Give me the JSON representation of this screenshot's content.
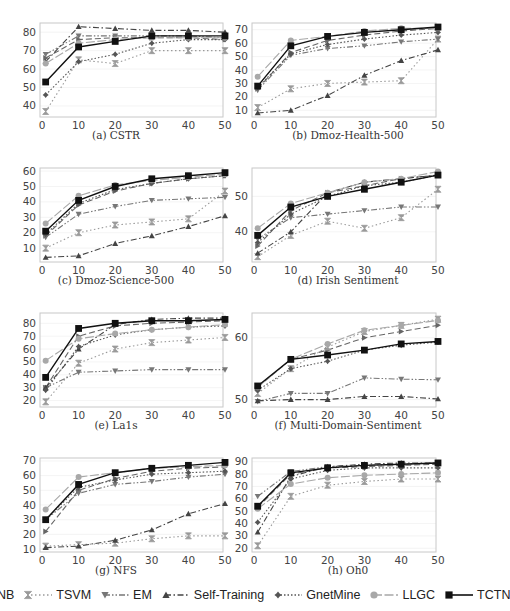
{
  "legend": [
    {
      "name": "MNB",
      "marker": "tri-right",
      "dash": "6,3",
      "color": "#666666"
    },
    {
      "name": "TSVM",
      "marker": "hourglass",
      "dash": "1.5,2.5",
      "color": "#9a9a9a"
    },
    {
      "name": "EM",
      "marker": "tri-down",
      "dash": "6,2,1.5,2,1.5,2",
      "color": "#777777"
    },
    {
      "name": "Self-Training",
      "marker": "tri-up",
      "dash": "6,2.5,1.5,2.5",
      "color": "#444444"
    },
    {
      "name": "GnetMine",
      "marker": "diamond-star",
      "dash": "1.5,2",
      "color": "#555555"
    },
    {
      "name": "LLGC",
      "marker": "circle",
      "dash": "9,2.5",
      "color": "#a8a8a8"
    },
    {
      "name": "TCTN",
      "marker": "square",
      "dash": "",
      "color": "#111111"
    }
  ],
  "chart_data": [
    {
      "id": "a",
      "caption": "(a) CSTR",
      "type": "line",
      "x": [
        1,
        10,
        20,
        30,
        40,
        50
      ],
      "xticks": [
        0,
        10,
        20,
        30,
        40,
        50
      ],
      "ylim": [
        34,
        85
      ],
      "yticks": [
        40,
        50,
        60,
        70,
        80
      ],
      "ytick_side": "left",
      "series": [
        {
          "name": "MNB",
          "values": [
            66,
            76,
            77,
            77,
            77,
            76
          ]
        },
        {
          "name": "TSVM",
          "values": [
            37,
            65,
            63,
            70,
            70,
            70
          ]
        },
        {
          "name": "EM",
          "values": [
            68,
            78,
            78,
            78,
            78,
            77
          ]
        },
        {
          "name": "Self-Training",
          "values": [
            64,
            83,
            82,
            81,
            81,
            80
          ]
        },
        {
          "name": "GnetMine",
          "values": [
            46,
            64,
            68,
            74,
            76,
            76
          ]
        },
        {
          "name": "LLGC",
          "values": [
            63,
            74,
            76,
            77,
            77,
            77
          ]
        },
        {
          "name": "TCTN",
          "values": [
            53,
            72,
            75,
            78,
            78,
            78
          ]
        }
      ]
    },
    {
      "id": "b",
      "caption": "(b) Dmoz-Health-500",
      "type": "line",
      "x": [
        1,
        10,
        20,
        30,
        40,
        50
      ],
      "xticks": [
        0,
        10,
        20,
        30,
        40,
        50
      ],
      "ylim": [
        5,
        75
      ],
      "yticks": [
        10,
        20,
        30,
        40,
        50,
        60,
        70
      ],
      "ytick_side": "left",
      "series": [
        {
          "name": "MNB",
          "values": [
            26,
            53,
            62,
            66,
            69,
            71
          ]
        },
        {
          "name": "TSVM",
          "values": [
            12,
            26,
            30,
            31,
            32,
            63
          ]
        },
        {
          "name": "EM",
          "values": [
            25,
            51,
            56,
            58,
            61,
            63
          ]
        },
        {
          "name": "Self-Training",
          "values": [
            8,
            10,
            21,
            36,
            47,
            55
          ]
        },
        {
          "name": "GnetMine",
          "values": [
            27,
            52,
            59,
            63,
            66,
            68
          ]
        },
        {
          "name": "LLGC",
          "values": [
            35,
            62,
            65,
            69,
            71,
            71
          ]
        },
        {
          "name": "TCTN",
          "values": [
            28,
            58,
            65,
            68,
            70,
            72
          ]
        }
      ]
    },
    {
      "id": "c",
      "caption": "(c) Dmoz-Science-500",
      "type": "line",
      "x": [
        1,
        10,
        20,
        30,
        40,
        50
      ],
      "xticks": [
        0,
        10,
        20,
        30,
        40,
        50
      ],
      "ylim": [
        1,
        62
      ],
      "yticks": [
        10,
        20,
        30,
        40,
        50,
        60
      ],
      "ytick_side": "left",
      "series": [
        {
          "name": "MNB",
          "values": [
            18,
            38,
            47,
            52,
            55,
            57
          ]
        },
        {
          "name": "TSVM",
          "values": [
            10,
            20,
            25,
            27,
            29,
            47
          ]
        },
        {
          "name": "EM",
          "values": [
            17,
            32,
            37,
            41,
            42,
            43
          ]
        },
        {
          "name": "Self-Training",
          "values": [
            4,
            5,
            13,
            18,
            24,
            31
          ]
        },
        {
          "name": "GnetMine",
          "values": [
            19,
            39,
            48,
            52,
            55,
            57
          ]
        },
        {
          "name": "LLGC",
          "values": [
            26,
            44,
            51,
            54,
            56,
            58
          ]
        },
        {
          "name": "TCTN",
          "values": [
            21,
            41,
            50,
            55,
            57,
            59
          ]
        }
      ]
    },
    {
      "id": "d",
      "caption": "(d) Irish Sentiment",
      "type": "line",
      "x": [
        1,
        10,
        20,
        30,
        40,
        50
      ],
      "xticks": [
        0,
        10,
        20,
        30,
        40,
        50
      ],
      "ylim": [
        31.5,
        58
      ],
      "yticks": [
        40,
        50
      ],
      "ytick_side": "left",
      "series": [
        {
          "name": "MNB",
          "values": [
            36,
            46,
            51,
            53,
            55,
            56
          ]
        },
        {
          "name": "TSVM",
          "values": [
            33,
            39,
            43,
            41,
            44,
            52
          ]
        },
        {
          "name": "EM",
          "values": [
            38,
            44,
            45,
            46,
            47,
            47
          ]
        },
        {
          "name": "Self-Training",
          "values": [
            34,
            40,
            51,
            54,
            55,
            56
          ]
        },
        {
          "name": "GnetMine",
          "values": [
            37,
            45,
            50,
            53,
            54,
            56
          ]
        },
        {
          "name": "LLGC",
          "values": [
            41,
            48,
            51,
            54,
            55,
            57
          ]
        },
        {
          "name": "TCTN",
          "values": [
            39,
            47,
            50,
            52,
            54,
            56
          ]
        }
      ]
    },
    {
      "id": "e",
      "caption": "(e) La1s",
      "type": "line",
      "x": [
        1,
        10,
        20,
        30,
        40,
        50
      ],
      "xticks": [
        0,
        10,
        20,
        30,
        40,
        50
      ],
      "ylim": [
        15,
        88
      ],
      "yticks": [
        20,
        30,
        40,
        50,
        60,
        70,
        80
      ],
      "ytick_side": "left",
      "series": [
        {
          "name": "MNB",
          "values": [
            30,
            70,
            78,
            80,
            81,
            82
          ]
        },
        {
          "name": "TSVM",
          "values": [
            19,
            49,
            60,
            65,
            67,
            69
          ]
        },
        {
          "name": "EM",
          "values": [
            30,
            42,
            43,
            44,
            44,
            44
          ]
        },
        {
          "name": "Self-Training",
          "values": [
            30,
            60,
            79,
            83,
            84,
            84
          ]
        },
        {
          "name": "GnetMine",
          "values": [
            28,
            62,
            71,
            75,
            77,
            78
          ]
        },
        {
          "name": "LLGC",
          "values": [
            51,
            68,
            72,
            75,
            77,
            79
          ]
        },
        {
          "name": "TCTN",
          "values": [
            38,
            76,
            80,
            82,
            82,
            83
          ]
        }
      ]
    },
    {
      "id": "f",
      "caption": "(f) Multi-Domain-Sentiment",
      "type": "line",
      "x": [
        1,
        10,
        20,
        30,
        40,
        50
      ],
      "xticks": [
        0,
        10,
        20,
        30,
        40,
        50
      ],
      "ylim": [
        48.8,
        64
      ],
      "yticks": [
        50,
        60
      ],
      "ytick_side": "left",
      "series": [
        {
          "name": "MNB",
          "values": [
            52,
            56.5,
            58,
            60,
            61,
            62
          ]
        },
        {
          "name": "TSVM",
          "values": [
            51,
            55,
            58.5,
            61,
            62,
            63
          ]
        },
        {
          "name": "EM",
          "values": [
            49.7,
            51,
            51,
            53.5,
            53.3,
            53.2
          ]
        },
        {
          "name": "Self-Training",
          "values": [
            49.8,
            50,
            50,
            50.5,
            50.5,
            50.1
          ]
        },
        {
          "name": "GnetMine",
          "values": [
            51.5,
            55,
            56.2,
            58,
            58.8,
            59.3
          ]
        },
        {
          "name": "LLGC",
          "values": [
            52,
            56.5,
            59,
            61.2,
            62,
            62.8
          ]
        },
        {
          "name": "TCTN",
          "values": [
            52.2,
            56.5,
            57.2,
            58,
            59,
            59.4
          ]
        }
      ]
    },
    {
      "id": "g",
      "caption": "(g) NFS",
      "type": "line",
      "x": [
        1,
        10,
        20,
        30,
        40,
        50
      ],
      "xticks": [
        0,
        10,
        20,
        30,
        40,
        50
      ],
      "ylim": [
        8,
        72
      ],
      "yticks": [
        10,
        20,
        30,
        40,
        50,
        60,
        70
      ],
      "ytick_side": "left",
      "series": [
        {
          "name": "MNB",
          "values": [
            22,
            50,
            58,
            63,
            65,
            66
          ]
        },
        {
          "name": "TSVM",
          "values": [
            12,
            13,
            14,
            17,
            19,
            19
          ]
        },
        {
          "name": "EM",
          "values": [
            30,
            48,
            54,
            56,
            59,
            61
          ]
        },
        {
          "name": "Self-Training",
          "values": [
            11,
            12,
            16,
            23,
            34,
            41
          ]
        },
        {
          "name": "GnetMine",
          "values": [
            30,
            52,
            57,
            61,
            62,
            63
          ]
        },
        {
          "name": "LLGC",
          "values": [
            37,
            59,
            62,
            65,
            66,
            67
          ]
        },
        {
          "name": "TCTN",
          "values": [
            30,
            54,
            62,
            65,
            67,
            69
          ]
        }
      ]
    },
    {
      "id": "h",
      "caption": "(h) Oh0",
      "type": "line",
      "x": [
        1,
        10,
        20,
        30,
        40,
        50
      ],
      "xticks": [
        0,
        10,
        20,
        30,
        40,
        50
      ],
      "ylim": [
        17,
        93
      ],
      "yticks": [
        20,
        30,
        40,
        50,
        60,
        70,
        80,
        90
      ],
      "ytick_side": "left",
      "series": [
        {
          "name": "MNB",
          "values": [
            53,
            80,
            85,
            86,
            87,
            88
          ]
        },
        {
          "name": "TSVM",
          "values": [
            22,
            62,
            71,
            74,
            76,
            76
          ]
        },
        {
          "name": "EM",
          "values": [
            62,
            82,
            86,
            87,
            88,
            89
          ]
        },
        {
          "name": "Self-Training",
          "values": [
            33,
            78,
            86,
            88,
            89,
            89
          ]
        },
        {
          "name": "GnetMine",
          "values": [
            41,
            76,
            83,
            85,
            85,
            85
          ]
        },
        {
          "name": "LLGC",
          "values": [
            52,
            72,
            77,
            79,
            80,
            81
          ]
        },
        {
          "name": "TCTN",
          "values": [
            54,
            81,
            85,
            87,
            88,
            89
          ]
        }
      ]
    }
  ]
}
